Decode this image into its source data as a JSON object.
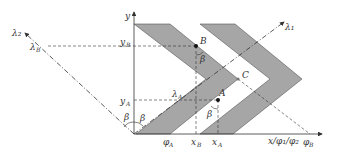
{
  "diagram": {
    "axes": {
      "y_label": "y",
      "x_label": "x/φ₁/φ₂",
      "lambda1": "λ₁",
      "lambda2": "λ₂"
    },
    "points": {
      "A": "A",
      "B": "B",
      "C": "C"
    },
    "ticks": {
      "yB": "y",
      "yB_sub": "B",
      "yA": "y",
      "yA_sub": "A",
      "lambdaB": "λ",
      "lambdaB_sub": "B",
      "lambdaA": "λ",
      "lambdaA_sub": "A",
      "phiA": "φ",
      "phiA_sub": "A",
      "phiB": "φ",
      "phiB_sub": "B",
      "xB": "x",
      "xB_sub": "B",
      "xA": "x",
      "xA_sub": "A"
    },
    "angles": {
      "beta": "β"
    },
    "colors": {
      "band_fill": "#a6a6a6",
      "line": "#333333"
    }
  }
}
